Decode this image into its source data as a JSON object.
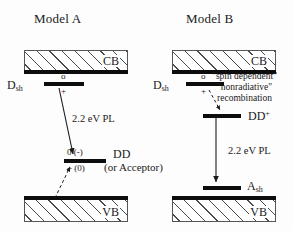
{
  "figure": {
    "caption_type": "energy-band-diagram",
    "panels": [
      {
        "id": "model-a",
        "title": "Model A",
        "bands": {
          "conduction": "CB",
          "valence": "VB"
        },
        "levels": [
          {
            "name": "D",
            "subscript": "sh",
            "charge_upper": "o",
            "charge_lower": "+"
          },
          {
            "name": "DD",
            "alt_name": "(or Acceptor)",
            "charge_upper": "0 (-)",
            "charge_lower": "+ (0)"
          }
        ],
        "transitions": [
          {
            "label": "2.2 eV PL",
            "style": "solid"
          },
          {
            "label": "",
            "style": "dashed"
          }
        ]
      },
      {
        "id": "model-b",
        "title": "Model B",
        "bands": {
          "conduction": "CB",
          "valence": "VB"
        },
        "levels": [
          {
            "name": "D",
            "subscript": "sh",
            "charge_upper": "o",
            "charge_lower": "+"
          },
          {
            "name": "DD",
            "superscript": "+",
            "charge_upper": "",
            "charge_lower": ""
          },
          {
            "name": "A",
            "subscript": "sh",
            "charge_upper": "",
            "charge_lower": ""
          }
        ],
        "annotation": {
          "line1": "\"spin dependent\"",
          "line2": "\"nonradiative\"",
          "line3": "recombination"
        },
        "transitions": [
          {
            "label": "2.2 eV PL",
            "style": "solid"
          },
          {
            "label": "",
            "style": "dashed"
          }
        ]
      }
    ],
    "colors": {
      "ink": "#0d0d0d",
      "hatch": "#4a4a4a",
      "background": "#fdfdfd"
    }
  }
}
